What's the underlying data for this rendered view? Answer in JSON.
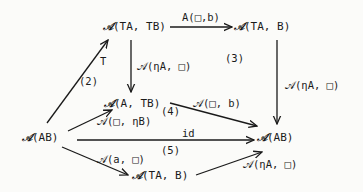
{
  "diagram": {
    "type": "commutative-diagram",
    "nodes": {
      "top_left": {
        "symbol": "𝒜",
        "text": "(TA, TB)"
      },
      "top_right": {
        "symbol": "𝒜",
        "text": "(TA, B)"
      },
      "middle": {
        "symbol": "𝒜",
        "text": "(A, TB)"
      },
      "left": {
        "symbol": "𝒜",
        "text": "(AB)"
      },
      "right": {
        "symbol": "𝒜",
        "text": "(AB)"
      },
      "bottom": {
        "symbol": "𝒜",
        "text": "(TA, B)"
      }
    },
    "edges": {
      "top": {
        "label": "A(□,b)"
      },
      "left_up": {
        "label": "T"
      },
      "middle_down": {
        "label": "𝒜(ηA, □)"
      },
      "right_down": {
        "label": "𝒜(ηA, □)"
      },
      "left_to_middle": {
        "label": "𝒜(□, ηB)"
      },
      "middle_to_right": {
        "label": "𝒜(□, b)"
      },
      "identity": {
        "label": "id"
      },
      "left_to_bottom": {
        "label": "𝒜(a, □)"
      },
      "bottom_to_right": {
        "label": "𝒜(ηA, □)"
      }
    },
    "regions": [
      "(2)",
      "(3)",
      "(4)",
      "(5)"
    ]
  }
}
